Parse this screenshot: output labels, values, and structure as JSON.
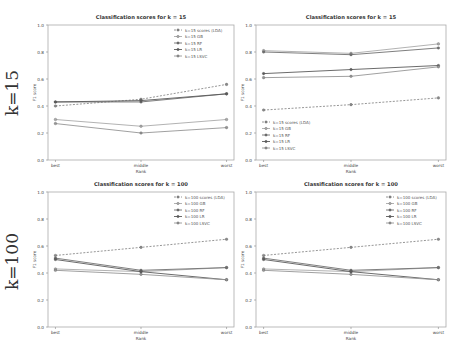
{
  "row_labels": [
    "k=15",
    "k=100"
  ],
  "chart_data": [
    {
      "type": "line",
      "title": "Classification scores for k = 15",
      "xlabel": "Rank",
      "ylabel": "F1 score",
      "categories": [
        "best",
        "middle",
        "worst"
      ],
      "ylim": [
        0.0,
        1.0
      ],
      "yticks": [
        "0.0",
        "0.2",
        "0.4",
        "0.6",
        "0.8",
        "1.0"
      ],
      "grid": false,
      "legend_position": "upper right",
      "series": [
        {
          "name": "k=15 scores (LDA)",
          "values": [
            0.4,
            0.45,
            0.56
          ],
          "dashed": true,
          "color": "#8a8a8a"
        },
        {
          "name": "k=15 GB",
          "values": [
            0.3,
            0.25,
            0.3
          ],
          "dashed": false,
          "color": "#a9a9a9"
        },
        {
          "name": "k=15 RF",
          "values": [
            0.43,
            0.43,
            0.49
          ],
          "dashed": false,
          "color": "#707070"
        },
        {
          "name": "k=15 LR",
          "values": [
            0.43,
            0.44,
            0.49
          ],
          "dashed": false,
          "color": "#5a5a5a"
        },
        {
          "name": "k=15 LSVC",
          "values": [
            0.27,
            0.2,
            0.24
          ],
          "dashed": false,
          "color": "#959595"
        }
      ]
    },
    {
      "type": "line",
      "title": "Classification scores for k = 15",
      "xlabel": "Rank",
      "ylabel": "F1 score",
      "categories": [
        "best",
        "middle",
        "worst"
      ],
      "ylim": [
        0.0,
        1.0
      ],
      "yticks": [
        "0.0",
        "0.2",
        "0.4",
        "0.6",
        "0.8",
        "1.0"
      ],
      "grid": false,
      "legend_position": "lower left",
      "series": [
        {
          "name": "k=15 scores (LDA)",
          "values": [
            0.37,
            0.41,
            0.46
          ],
          "dashed": true,
          "color": "#8a8a8a"
        },
        {
          "name": "k=15 GB",
          "values": [
            0.81,
            0.79,
            0.86
          ],
          "dashed": false,
          "color": "#a9a9a9"
        },
        {
          "name": "k=15 RF",
          "values": [
            0.8,
            0.78,
            0.83
          ],
          "dashed": false,
          "color": "#707070"
        },
        {
          "name": "k=15 LR",
          "values": [
            0.64,
            0.67,
            0.7
          ],
          "dashed": false,
          "color": "#5a5a5a"
        },
        {
          "name": "k=15 LSVC",
          "values": [
            0.61,
            0.62,
            0.69
          ],
          "dashed": false,
          "color": "#959595"
        }
      ]
    },
    {
      "type": "line",
      "title": "Classification scores for k = 100",
      "xlabel": "Rank",
      "ylabel": "F1 score",
      "categories": [
        "best",
        "middle",
        "worst"
      ],
      "ylim": [
        0.0,
        1.0
      ],
      "yticks": [
        "0.0",
        "0.2",
        "0.4",
        "0.6",
        "0.8",
        "1.0"
      ],
      "grid": false,
      "legend_position": "upper right",
      "series": [
        {
          "name": "k=100 scores (LDA)",
          "values": [
            0.53,
            0.59,
            0.65
          ],
          "dashed": true,
          "color": "#8a8a8a"
        },
        {
          "name": "k=100 GB",
          "values": [
            0.43,
            0.41,
            0.44
          ],
          "dashed": false,
          "color": "#a9a9a9"
        },
        {
          "name": "k=100 RF",
          "values": [
            0.51,
            0.42,
            0.44
          ],
          "dashed": false,
          "color": "#707070"
        },
        {
          "name": "k=100 LR",
          "values": [
            0.5,
            0.41,
            0.35
          ],
          "dashed": false,
          "color": "#5a5a5a"
        },
        {
          "name": "k=100 LSVC",
          "values": [
            0.42,
            0.39,
            0.35
          ],
          "dashed": false,
          "color": "#959595"
        }
      ]
    },
    {
      "type": "line",
      "title": "Classification scores for k = 100",
      "xlabel": "Rank",
      "ylabel": "F1 score",
      "categories": [
        "best",
        "middle",
        "worst"
      ],
      "ylim": [
        0.0,
        1.0
      ],
      "yticks": [
        "0.0",
        "0.2",
        "0.4",
        "0.6",
        "0.8",
        "1.0"
      ],
      "grid": false,
      "legend_position": "upper right",
      "series": [
        {
          "name": "k=100 scores (LDA)",
          "values": [
            0.53,
            0.59,
            0.65
          ],
          "dashed": true,
          "color": "#8a8a8a"
        },
        {
          "name": "k=100 GB",
          "values": [
            0.43,
            0.41,
            0.44
          ],
          "dashed": false,
          "color": "#a9a9a9"
        },
        {
          "name": "k=100 RF",
          "values": [
            0.51,
            0.42,
            0.44
          ],
          "dashed": false,
          "color": "#707070"
        },
        {
          "name": "k=100 LR",
          "values": [
            0.5,
            0.41,
            0.35
          ],
          "dashed": false,
          "color": "#5a5a5a"
        },
        {
          "name": "k=100 LSVC",
          "values": [
            0.42,
            0.39,
            0.35
          ],
          "dashed": false,
          "color": "#959595"
        }
      ]
    }
  ]
}
